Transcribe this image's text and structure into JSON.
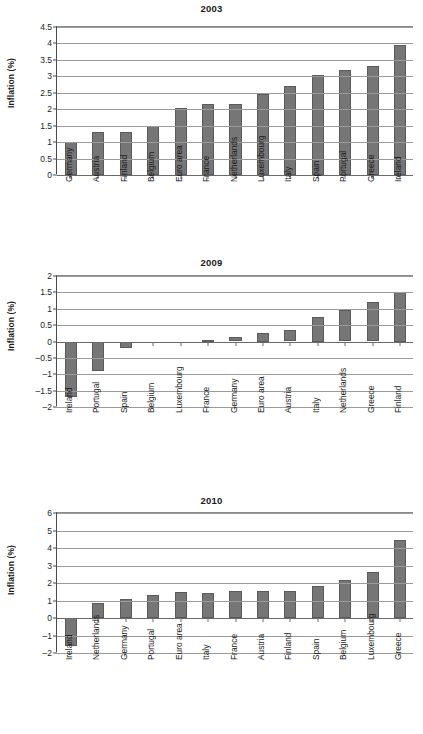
{
  "figure": {
    "ylabel": "Inflation (%)"
  },
  "chart_data": [
    {
      "type": "bar",
      "title": "2003",
      "xlabel": "",
      "ylabel": "Inflation (%)",
      "ylim": [
        0,
        4.5
      ],
      "ytick_step": 0.5,
      "yticks": [
        "0",
        "0.5",
        "1",
        "1.5",
        "2",
        "2.5",
        "3",
        "3.5",
        "4",
        "4.5"
      ],
      "grid": true,
      "legend": "none",
      "categories": [
        "Germany",
        "Austria",
        "Finland",
        "Belgium",
        "Euro area",
        "France",
        "Netherlands",
        "Luxembourg",
        "Italy",
        "Spain",
        "Portugal",
        "Greece",
        "Ireland"
      ],
      "values": [
        1.0,
        1.3,
        1.3,
        1.5,
        2.05,
        2.15,
        2.15,
        2.45,
        2.7,
        3.05,
        3.2,
        3.3,
        3.95
      ]
    },
    {
      "type": "bar",
      "title": "2009",
      "xlabel": "",
      "ylabel": "Inflation (%)",
      "ylim": [
        -2,
        2
      ],
      "ytick_step": 0.5,
      "yticks": [
        "-2",
        "-1.5",
        "-1",
        "-0.5",
        "0",
        "0.5",
        "1",
        "1.5",
        "2"
      ],
      "grid": true,
      "legend": "none",
      "categories": [
        "Ireland",
        "Portugal",
        "Spain",
        "Belgium",
        "Luxembourg",
        "France",
        "Germany",
        "Euro area",
        "Austria",
        "Italy",
        "Netherlands",
        "Greece",
        "Finland"
      ],
      "values": [
        -1.7,
        -0.9,
        -0.2,
        0.0,
        0.0,
        0.05,
        0.15,
        0.25,
        0.35,
        0.75,
        0.95,
        1.2,
        1.5
      ]
    },
    {
      "type": "bar",
      "title": "2010",
      "xlabel": "",
      "ylabel": "Inflation (%)",
      "ylim": [
        -2,
        6
      ],
      "ytick_step": 1,
      "yticks": [
        "-2",
        "-1",
        "0",
        "1",
        "2",
        "3",
        "4",
        "5",
        "6"
      ],
      "grid": true,
      "legend": "none",
      "categories": [
        "Ireland",
        "Netherlands",
        "Germany",
        "Portugal",
        "Euro area",
        "Italy",
        "France",
        "Austria",
        "Finland",
        "Spain",
        "Belgium",
        "Luxembourg",
        "Greece"
      ],
      "values": [
        -1.6,
        0.85,
        1.1,
        1.3,
        1.5,
        1.45,
        1.55,
        1.55,
        1.55,
        1.85,
        2.15,
        2.65,
        4.45
      ]
    }
  ],
  "style": {
    "bar_fill": "#767676",
    "bar_stroke": "#5a5a5a",
    "grid_color": "#9a9a9a",
    "axis_color": "#4a4a4a",
    "background": "#ffffff"
  }
}
